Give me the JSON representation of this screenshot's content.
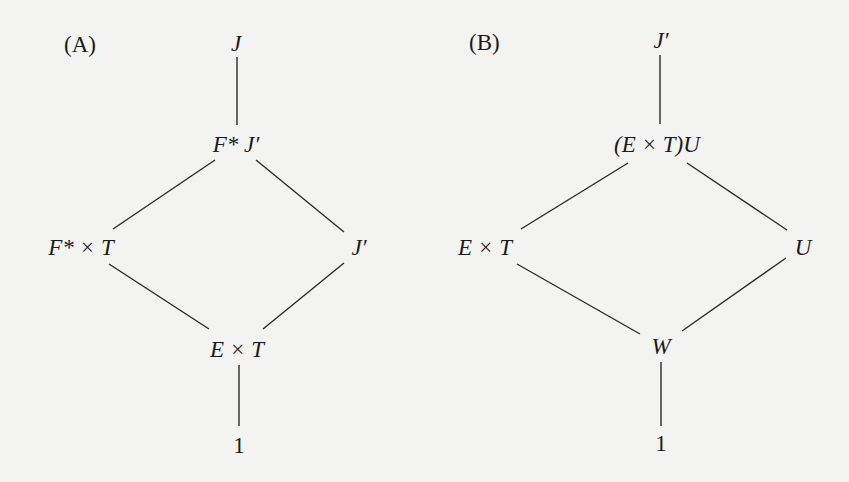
{
  "diagram_a": {
    "label": "(A)",
    "nodes": {
      "top": "J",
      "upper_mid": "F* J′",
      "left": "F* × T",
      "right": "J′",
      "lower_mid": "E × T",
      "bottom": "1"
    }
  },
  "diagram_b": {
    "label": "(B)",
    "nodes": {
      "top": "J′",
      "upper_mid": "(E × T)U",
      "left": "E × T",
      "right": "U",
      "lower_mid": "W",
      "bottom": "1"
    }
  },
  "colors": {
    "background": "#f3f3f1",
    "ink": "#1c1c1c"
  }
}
